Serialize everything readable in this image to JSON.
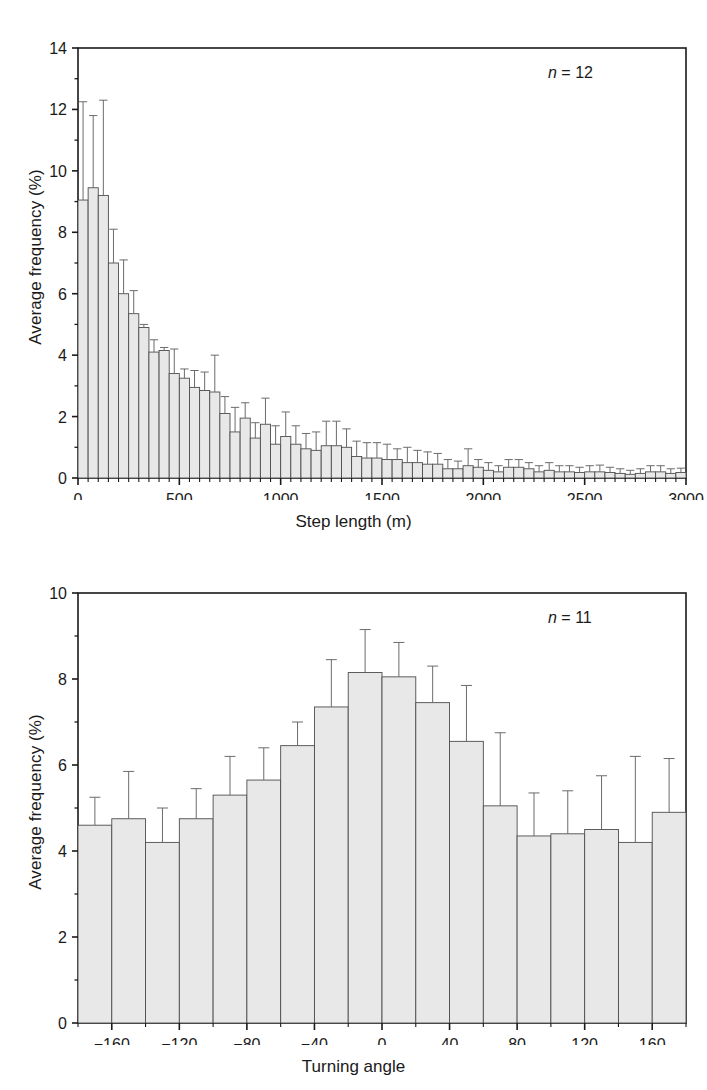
{
  "figure": {
    "background": "#ffffff",
    "bar_fill": "#e8e8e8",
    "bar_stroke": "#4d4d4d",
    "axis_color": "#1a1a1a",
    "error_color": "#6b6b6b"
  },
  "panels": [
    {
      "id": "step-length-histogram",
      "annotation_n_prefix": "n",
      "annotation_n_eq": " = ",
      "annotation_n_value": "12",
      "chart_data": {
        "type": "bar",
        "title": "",
        "xlabel": "Step length (m)",
        "ylabel": "Average frequency (%)",
        "xlim": [
          0,
          3000
        ],
        "ylim": [
          0,
          14
        ],
        "ytick_step": 2,
        "yticks": [
          0,
          2,
          4,
          6,
          8,
          10,
          12,
          14
        ],
        "ytick_labels": [
          "0",
          "2",
          "4",
          "6",
          "8",
          "10",
          "12",
          "14"
        ],
        "xticks": [
          0,
          500,
          1000,
          1500,
          2000,
          2500,
          3000
        ],
        "xtick_labels": [
          "0",
          "500",
          "1000",
          "1500",
          "2000",
          "2500",
          "3000"
        ],
        "minor_xtick_step": 50,
        "grid": false,
        "legend": "none",
        "bin_width": 50,
        "bin_starts": [
          0,
          50,
          100,
          150,
          200,
          250,
          300,
          350,
          400,
          450,
          500,
          550,
          600,
          650,
          700,
          750,
          800,
          850,
          900,
          950,
          1000,
          1050,
          1100,
          1150,
          1200,
          1250,
          1300,
          1350,
          1400,
          1450,
          1500,
          1550,
          1600,
          1650,
          1700,
          1750,
          1800,
          1850,
          1900,
          1950,
          2000,
          2050,
          2100,
          2150,
          2200,
          2250,
          2300,
          2350,
          2400,
          2450,
          2500,
          2550,
          2600,
          2650,
          2700,
          2750,
          2800,
          2850,
          2900,
          2950
        ],
        "values": [
          9.05,
          9.45,
          9.2,
          7.0,
          6.0,
          5.35,
          4.9,
          4.1,
          4.15,
          3.4,
          3.25,
          2.95,
          2.85,
          2.8,
          2.1,
          1.5,
          1.95,
          1.3,
          1.75,
          1.1,
          1.35,
          1.1,
          0.95,
          0.9,
          1.05,
          1.05,
          1.0,
          0.7,
          0.65,
          0.65,
          0.6,
          0.6,
          0.5,
          0.5,
          0.45,
          0.45,
          0.3,
          0.3,
          0.4,
          0.35,
          0.25,
          0.2,
          0.35,
          0.35,
          0.3,
          0.2,
          0.25,
          0.2,
          0.2,
          0.18,
          0.2,
          0.2,
          0.18,
          0.15,
          0.12,
          0.15,
          0.2,
          0.2,
          0.15,
          0.18
        ],
        "errors_upper": [
          12.25,
          11.8,
          12.3,
          8.1,
          7.1,
          6.1,
          5.0,
          4.5,
          4.25,
          4.2,
          3.55,
          3.5,
          3.45,
          4.0,
          2.65,
          2.3,
          2.45,
          1.8,
          2.6,
          1.7,
          2.15,
          1.7,
          1.45,
          1.5,
          1.85,
          1.85,
          1.6,
          1.2,
          1.15,
          1.15,
          1.1,
          0.95,
          1.0,
          0.9,
          0.85,
          0.8,
          0.6,
          0.55,
          0.95,
          0.6,
          0.5,
          0.4,
          0.6,
          0.6,
          0.5,
          0.4,
          0.5,
          0.4,
          0.4,
          0.35,
          0.4,
          0.42,
          0.35,
          0.3,
          0.25,
          0.3,
          0.4,
          0.4,
          0.3,
          0.32
        ],
        "error_type": "upper-only with cap"
      }
    },
    {
      "id": "turning-angle-histogram",
      "annotation_n_prefix": "n",
      "annotation_n_eq": " = ",
      "annotation_n_value": "11",
      "chart_data": {
        "type": "bar",
        "title": "",
        "xlabel": "Turning angle",
        "ylabel": "Average frequency (%)",
        "xlim": [
          -180,
          180
        ],
        "ylim": [
          0,
          10
        ],
        "ytick_step": 2,
        "yticks": [
          0,
          2,
          4,
          6,
          8,
          10
        ],
        "ytick_labels": [
          "0",
          "2",
          "4",
          "6",
          "8",
          "10"
        ],
        "xticks": [
          -160,
          -120,
          -80,
          -40,
          0,
          40,
          80,
          120,
          160
        ],
        "xtick_labels": [
          "−160",
          "−120",
          "−80",
          "−40",
          "0",
          "40",
          "80",
          "120",
          "160"
        ],
        "minor_xtick_step": 20,
        "grid": false,
        "legend": "none",
        "bin_width": 20,
        "bin_starts": [
          -180,
          -160,
          -140,
          -120,
          -100,
          -80,
          -60,
          -40,
          -20,
          0,
          20,
          40,
          60,
          80,
          100,
          120,
          140,
          160
        ],
        "bin_centers": [
          -170,
          -150,
          -130,
          -110,
          -90,
          -70,
          -50,
          -30,
          -10,
          10,
          30,
          50,
          70,
          90,
          110,
          130,
          150,
          170
        ],
        "values": [
          4.6,
          4.75,
          4.2,
          4.75,
          5.3,
          5.65,
          6.45,
          7.35,
          8.15,
          8.05,
          7.45,
          6.55,
          5.05,
          4.35,
          4.4,
          4.5,
          4.2,
          4.9
        ],
        "errors_upper": [
          5.25,
          5.85,
          5.0,
          5.45,
          6.2,
          6.4,
          7.0,
          8.45,
          9.15,
          8.85,
          8.3,
          7.85,
          6.75,
          5.35,
          5.4,
          5.75,
          6.2,
          6.15
        ],
        "error_type": "upper-only with cap"
      }
    }
  ]
}
